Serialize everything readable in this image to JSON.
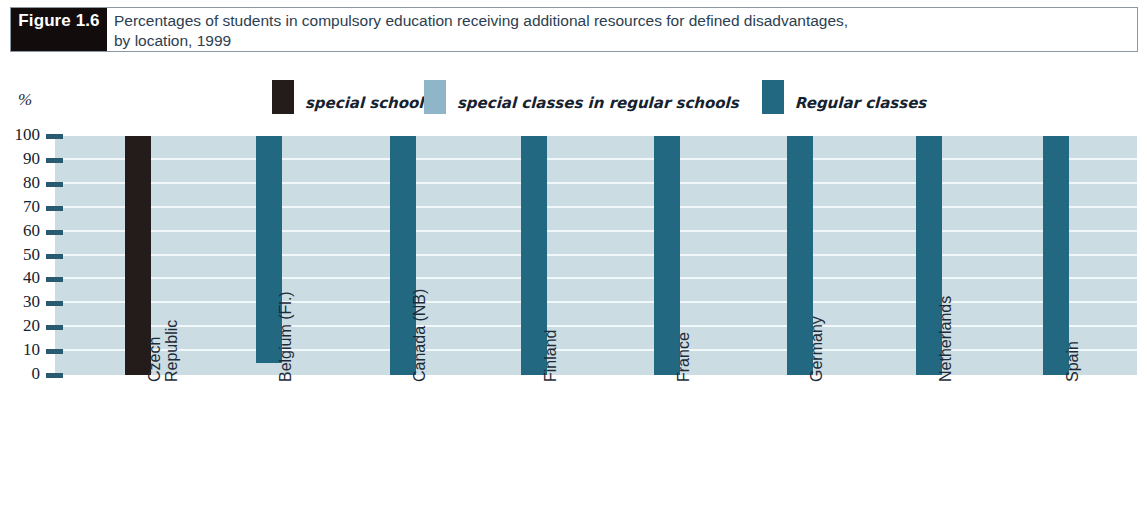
{
  "figure": {
    "tag": "Figure 1.6",
    "title_line1": "Percentages of students in compulsory education receiving additional resources for defined disadvantages,",
    "title_line2": "by location, 1999"
  },
  "axis": {
    "unit_label": "%",
    "ticks": [
      "100",
      "90",
      "80",
      "70",
      "60",
      "50",
      "40",
      "30",
      "20",
      "10",
      "0"
    ]
  },
  "legend": {
    "items": [
      {
        "label": "special schools",
        "color": "#241c1a",
        "name": "special-schools"
      },
      {
        "label": "special classes in regular schools",
        "color": "#8fb5c8",
        "name": "special-classes-in-regular-schools"
      },
      {
        "label": "Regular classes",
        "color": "#216880",
        "name": "regular-classes"
      }
    ]
  },
  "colors": {
    "special_schools": "#241c1a",
    "special_classes": "#cbdce3",
    "regular_classes": "#216880",
    "plot_background": "#cbdce3",
    "gridline": "#f2f8fa",
    "tick": "#2a5a72",
    "title_text": "#2c3e50",
    "figure_tag_bg": "#120d0c"
  },
  "chart_data": {
    "type": "bar",
    "title": "Percentages of students in compulsory education receiving additional resources for defined disadvantages, by location, 1999",
    "xlabel": "",
    "ylabel": "%",
    "ylim": [
      0,
      100
    ],
    "yticks": [
      0,
      10,
      20,
      30,
      40,
      50,
      60,
      70,
      80,
      90,
      100
    ],
    "grid": true,
    "legend_position": "top",
    "categories": [
      "Czech Republic",
      "Belgium (Fl.)",
      "Canada (NB)",
      "Finland",
      "France",
      "Germany",
      "Netherlands",
      "Spain"
    ],
    "category_lines": [
      [
        "Czech",
        "Republic"
      ],
      [
        "Belgium (Fl.)"
      ],
      [
        "Canada (NB)"
      ],
      [
        "Finland"
      ],
      [
        "France"
      ],
      [
        "Germany"
      ],
      [
        "Netherlands"
      ],
      [
        "Spain"
      ]
    ],
    "series": [
      {
        "name": "special schools",
        "color": "#241c1a",
        "values": [
          100,
          0,
          0,
          0,
          0,
          0,
          0,
          0
        ]
      },
      {
        "name": "special classes in regular schools",
        "color": "#cbdce3",
        "values": [
          0,
          5,
          0,
          0,
          0,
          0,
          0,
          0
        ]
      },
      {
        "name": "Regular classes",
        "color": "#216880",
        "values": [
          0,
          95,
          100,
          100,
          100,
          100,
          100,
          100
        ]
      }
    ],
    "bars": [
      {
        "category": "Czech Republic",
        "series": "special schools",
        "color": "#241c1a",
        "bottom": 0,
        "top": 100,
        "x_px": 125,
        "width_px": 26
      },
      {
        "category": "Belgium (Fl.)",
        "series": "Regular classes",
        "color": "#216880",
        "bottom": 5,
        "top": 100,
        "x_px": 256,
        "width_px": 26
      },
      {
        "category": "Canada (NB)",
        "series": "Regular classes",
        "color": "#216880",
        "bottom": 0,
        "top": 100,
        "x_px": 390,
        "width_px": 26
      },
      {
        "category": "Finland",
        "series": "Regular classes",
        "color": "#216880",
        "bottom": 0,
        "top": 100,
        "x_px": 521,
        "width_px": 26
      },
      {
        "category": "France",
        "series": "Regular classes",
        "color": "#216880",
        "bottom": 0,
        "top": 100,
        "x_px": 654,
        "width_px": 26
      },
      {
        "category": "Germany",
        "series": "Regular classes",
        "color": "#216880",
        "bottom": 0,
        "top": 100,
        "x_px": 787,
        "width_px": 26
      },
      {
        "category": "Netherlands",
        "series": "Regular classes",
        "color": "#216880",
        "bottom": 0,
        "top": 100,
        "x_px": 916,
        "width_px": 26
      },
      {
        "category": "Spain",
        "series": "Regular classes",
        "color": "#216880",
        "bottom": 0,
        "top": 100,
        "x_px": 1043,
        "width_px": 26
      }
    ]
  }
}
